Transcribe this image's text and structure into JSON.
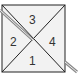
{
  "diagram": {
    "regions": [
      {
        "id": "top",
        "label": "3"
      },
      {
        "id": "left",
        "label": "2"
      },
      {
        "id": "right",
        "label": "4"
      },
      {
        "id": "bottom",
        "label": "1"
      }
    ],
    "colors": {
      "fill": "#f2f2f2",
      "stroke": "#222222",
      "stick": "#888888"
    }
  }
}
